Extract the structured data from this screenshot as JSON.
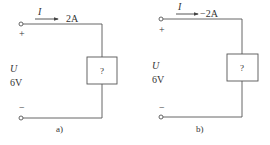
{
  "circuits": [
    {
      "id": "a",
      "caption": "a)",
      "current_symbol": "I",
      "current_value": "2A",
      "voltage_symbol": "U",
      "voltage_value": "6V",
      "plus_sign": "+",
      "minus_sign": "−",
      "element_label": "?"
    },
    {
      "id": "b",
      "caption": "b)",
      "current_symbol": "I",
      "current_value": "−2A",
      "voltage_symbol": "U",
      "voltage_value": "6V",
      "plus_sign": "+",
      "minus_sign": "−",
      "element_label": "?"
    }
  ],
  "colors": {
    "line": "#555555",
    "text": "#333333"
  }
}
